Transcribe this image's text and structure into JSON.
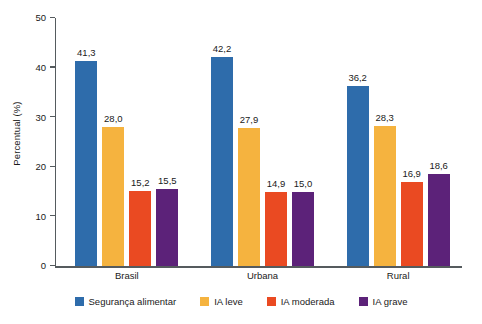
{
  "chart_data": {
    "type": "bar",
    "title": "",
    "subtitle": "",
    "xlabel": "",
    "ylabel": "Percentual (%)",
    "ylim": [
      0,
      50
    ],
    "yticks": [
      0,
      10,
      20,
      30,
      40,
      50
    ],
    "ytick_labels": [
      "0",
      "10",
      "20",
      "30",
      "40",
      "50"
    ],
    "grid": false,
    "legend_position": "bottom",
    "categories": [
      "Brasil",
      "Urbana",
      "Rural"
    ],
    "series": [
      {
        "name": "Segurança alimentar",
        "color": "#2e6cab",
        "values": [
          41.3,
          42.2,
          36.2
        ],
        "labels": [
          "41,3",
          "42,2",
          "36,2"
        ]
      },
      {
        "name": "IA leve",
        "color": "#f5b33f",
        "values": [
          28.0,
          27.9,
          28.3
        ],
        "labels": [
          "28,0",
          "27,9",
          "28,3"
        ]
      },
      {
        "name": "IA moderada",
        "color": "#ea4a22",
        "values": [
          15.2,
          14.9,
          16.9
        ],
        "labels": [
          "15,2",
          "14,9",
          "16,9"
        ]
      },
      {
        "name": "IA grave",
        "color": "#5c2279",
        "values": [
          15.5,
          15.0,
          18.6
        ],
        "labels": [
          "15,5",
          "15,0",
          "18,6"
        ]
      }
    ]
  },
  "axis": {
    "y_title": "Percentual (%)"
  }
}
